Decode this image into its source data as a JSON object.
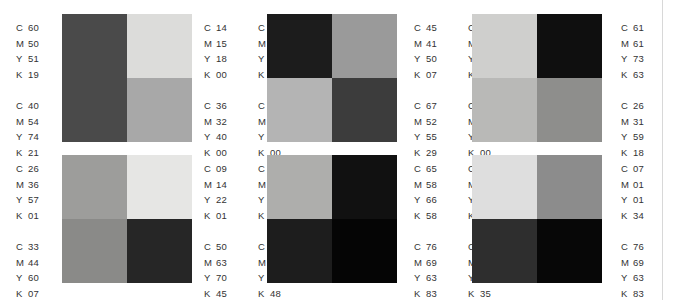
{
  "page": {
    "background_color": "#ffffff",
    "rule_color": "#d8d8d8",
    "text_color": "#333333",
    "channels": [
      "C",
      "M",
      "Y",
      "K"
    ]
  },
  "groups": [
    {
      "id": "group-1",
      "position": "top-left",
      "swatches": [
        {
          "cell": "top-left",
          "color": "#4a4a4a",
          "cmyk": {
            "C": "60",
            "M": "50",
            "Y": "51",
            "K": "19"
          }
        },
        {
          "cell": "top-right",
          "color": "#dcdcda",
          "cmyk": {
            "C": "14",
            "M": "15",
            "Y": "18",
            "K": "00"
          }
        },
        {
          "cell": "bottom-left",
          "color": "#4a4a4a",
          "cmyk": {
            "C": "40",
            "M": "54",
            "Y": "74",
            "K": "21"
          }
        },
        {
          "cell": "bottom-right",
          "color": "#a8a8a8",
          "cmyk": {
            "C": "36",
            "M": "32",
            "Y": "40",
            "K": "00"
          }
        }
      ],
      "label_columns": [
        [
          {
            "C": "60",
            "M": "50",
            "Y": "51",
            "K": "19"
          },
          {
            "C": "40",
            "M": "54",
            "Y": "74",
            "K": "21"
          }
        ],
        [
          {
            "C": "14",
            "M": "15",
            "Y": "18",
            "K": "00"
          },
          {
            "C": "36",
            "M": "32",
            "Y": "40",
            "K": "00"
          }
        ],
        [
          {
            "C": "74",
            "M": "64",
            "Y": "58",
            "K": "54"
          },
          {
            "C": "40",
            "M": "30",
            "Y": "30",
            "K": "00"
          }
        ]
      ]
    },
    {
      "id": "group-2",
      "position": "top-center",
      "swatches": [
        {
          "cell": "top-left",
          "color": "#1c1c1c",
          "cmyk": {
            "C": "74",
            "M": "64",
            "Y": "58",
            "K": "54"
          }
        },
        {
          "cell": "top-right",
          "color": "#9a9a9a",
          "cmyk": {
            "C": "40",
            "M": "30",
            "Y": "30",
            "K": "00"
          }
        },
        {
          "cell": "bottom-left",
          "color": "#b4b4b4",
          "cmyk": {
            "C": "45",
            "M": "41",
            "Y": "50",
            "K": "07"
          }
        },
        {
          "cell": "bottom-right",
          "color": "#3c3c3c",
          "cmyk": {
            "C": "67",
            "M": "52",
            "Y": "55",
            "K": "29"
          }
        }
      ],
      "label_columns": [
        [
          {
            "C": "45",
            "M": "41",
            "Y": "50",
            "K": "07"
          },
          {
            "C": "67",
            "M": "52",
            "Y": "55",
            "K": "29"
          }
        ],
        [
          {
            "C": "23",
            "M": "17",
            "Y": "33",
            "K": "00"
          },
          {
            "C": "30",
            "M": "25",
            "Y": "31",
            "K": "00"
          }
        ]
      ]
    },
    {
      "id": "group-3",
      "position": "top-right",
      "swatches": [
        {
          "cell": "top-left",
          "color": "#cfcfcd",
          "cmyk": {
            "C": "23",
            "M": "17",
            "Y": "33",
            "K": "00"
          }
        },
        {
          "cell": "top-right",
          "color": "#0f0f0f",
          "cmyk": {
            "C": "61",
            "M": "61",
            "Y": "73",
            "K": "63"
          }
        },
        {
          "cell": "bottom-left",
          "color": "#b9b9b7",
          "cmyk": {
            "C": "30",
            "M": "25",
            "Y": "31",
            "K": "00"
          }
        },
        {
          "cell": "bottom-right",
          "color": "#8e8e8c",
          "cmyk": {
            "C": "26",
            "M": "31",
            "Y": "59",
            "K": "18"
          }
        }
      ],
      "label_columns": [
        [
          {
            "C": "61",
            "M": "61",
            "Y": "73",
            "K": "63"
          },
          {
            "C": "26",
            "M": "31",
            "Y": "59",
            "K": "18"
          }
        ]
      ]
    },
    {
      "id": "group-4",
      "position": "bottom-left",
      "swatches": [
        {
          "cell": "top-left",
          "color": "#9d9d9b",
          "cmyk": {
            "C": "26",
            "M": "36",
            "Y": "57",
            "K": "01"
          }
        },
        {
          "cell": "top-right",
          "color": "#e6e6e4",
          "cmyk": {
            "C": "09",
            "M": "14",
            "Y": "22",
            "K": "01"
          }
        },
        {
          "cell": "bottom-left",
          "color": "#8a8a88",
          "cmyk": {
            "C": "33",
            "M": "44",
            "Y": "60",
            "K": "07"
          }
        },
        {
          "cell": "bottom-right",
          "color": "#262626",
          "cmyk": {
            "C": "50",
            "M": "63",
            "Y": "70",
            "K": "45"
          }
        }
      ],
      "label_columns": [
        [
          {
            "C": "26",
            "M": "36",
            "Y": "57",
            "K": "01"
          },
          {
            "C": "33",
            "M": "44",
            "Y": "60",
            "K": "07"
          }
        ],
        [
          {
            "C": "09",
            "M": "14",
            "Y": "22",
            "K": "01"
          },
          {
            "C": "50",
            "M": "63",
            "Y": "70",
            "K": "45"
          }
        ],
        [
          {
            "C": "38",
            "M": "32",
            "Y": "45",
            "K": "01"
          },
          {
            "C": "66",
            "M": "50",
            "Y": "67",
            "K": "48"
          }
        ]
      ]
    },
    {
      "id": "group-5",
      "position": "bottom-center",
      "swatches": [
        {
          "cell": "top-left",
          "color": "#aeaeac",
          "cmyk": {
            "C": "38",
            "M": "32",
            "Y": "45",
            "K": "01"
          }
        },
        {
          "cell": "top-right",
          "color": "#111111",
          "cmyk": {
            "C": "66",
            "M": "50",
            "Y": "67",
            "K": "48"
          }
        },
        {
          "cell": "bottom-left",
          "color": "#1d1d1d",
          "cmyk": {
            "C": "65",
            "M": "58",
            "Y": "66",
            "K": "58"
          }
        },
        {
          "cell": "bottom-right",
          "color": "#050505",
          "cmyk": {
            "C": "76",
            "M": "69",
            "Y": "63",
            "K": "83"
          }
        }
      ],
      "label_columns": [
        [
          {
            "C": "65",
            "M": "58",
            "Y": "66",
            "K": "58"
          },
          {
            "C": "76",
            "M": "69",
            "Y": "63",
            "K": "83"
          }
        ],
        [
          {
            "C": "15",
            "M": "12",
            "Y": "13",
            "K": "00"
          },
          {
            "C": "51",
            "M": "62",
            "Y": "62",
            "K": "35"
          }
        ]
      ]
    },
    {
      "id": "group-6",
      "position": "bottom-right",
      "swatches": [
        {
          "cell": "top-left",
          "color": "#dedede",
          "cmyk": {
            "C": "15",
            "M": "12",
            "Y": "13",
            "K": "00"
          }
        },
        {
          "cell": "top-right",
          "color": "#8c8c8c",
          "cmyk": {
            "C": "51",
            "M": "62",
            "Y": "62",
            "K": "35"
          }
        },
        {
          "cell": "bottom-left",
          "color": "#2e2e2e",
          "cmyk": {
            "C": "07",
            "M": "01",
            "Y": "01",
            "K": "34"
          }
        },
        {
          "cell": "bottom-right",
          "color": "#070707",
          "cmyk": {
            "C": "76",
            "M": "69",
            "Y": "63",
            "K": "83"
          }
        }
      ],
      "label_columns": [
        [
          {
            "C": "07",
            "M": "01",
            "Y": "01",
            "K": "34"
          },
          {
            "C": "76",
            "M": "69",
            "Y": "63",
            "K": "83"
          }
        ]
      ]
    }
  ]
}
